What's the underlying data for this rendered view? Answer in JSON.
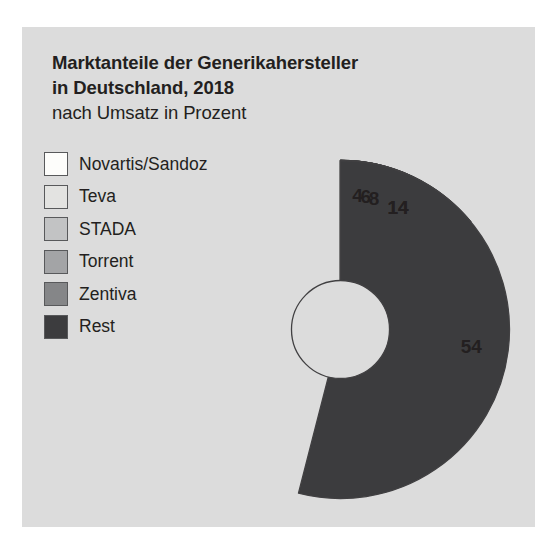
{
  "panel": {
    "background": "#dcdcdc"
  },
  "title": {
    "line1": "Marktanteile der Generikahersteller",
    "line2": "in Deutschland, 2018",
    "subtitle": "nach Umsatz in Prozent"
  },
  "legend": {
    "items": [
      {
        "label": "Novartis/Sandoz",
        "color": "#fdfdfb"
      },
      {
        "label": "Teva",
        "color": "#e3e3e1"
      },
      {
        "label": "STADA",
        "color": "#c2c3c4"
      },
      {
        "label": "Torrent",
        "color": "#a3a4a6"
      },
      {
        "label": "Zentiva",
        "color": "#858688"
      },
      {
        "label": "Rest",
        "color": "#3c3c3e"
      }
    ]
  },
  "chart_data": {
    "type": "pie",
    "variant": "donut",
    "title": "Marktanteile der Generikahersteller in Deutschland, 2018",
    "subtitle": "nach Umsatz in Prozent",
    "unit": "Prozent",
    "total": 100,
    "start_angle_deg": 0,
    "direction": "clockwise",
    "inner_radius_ratio": 0.29,
    "legend_position": "left",
    "grid": false,
    "labels": [
      "Novartis/Sandoz",
      "Teva",
      "STADA",
      "Torrent",
      "Zentiva",
      "Rest"
    ],
    "values": [
      14,
      14,
      8,
      6,
      4,
      54
    ],
    "colors": [
      "#fdfdfb",
      "#e3e3e1",
      "#c2c3c4",
      "#a3a4a6",
      "#858688",
      "#3c3c3e"
    ],
    "slices": [
      {
        "name": "Novartis/Sandoz",
        "value": 14,
        "display": "14",
        "color": "#fdfdfb"
      },
      {
        "name": "Teva",
        "value": 14,
        "display": "14",
        "color": "#e3e3e1"
      },
      {
        "name": "STADA",
        "value": 8,
        "display": "8",
        "color": "#c2c3c4"
      },
      {
        "name": "Torrent",
        "value": 6,
        "display": "6",
        "color": "#a3a4a6"
      },
      {
        "name": "Zentiva",
        "value": 4,
        "display": "4",
        "color": "#858688"
      },
      {
        "name": "Rest",
        "value": 54,
        "display": "54",
        "color": "#3c3c3e"
      }
    ]
  }
}
